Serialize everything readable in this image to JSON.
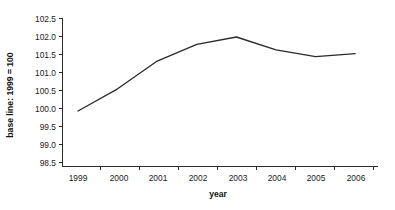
{
  "chart_data": {
    "type": "line",
    "title": "",
    "subtitle": "",
    "xlabel": "year",
    "ylabel": "base line: 1999 = 100",
    "categories": [
      "1999",
      "2000",
      "2001",
      "2002",
      "2003",
      "2004",
      "2005",
      "2006"
    ],
    "x": [
      1999,
      2000,
      2001,
      2002,
      2003,
      2004,
      2005,
      2006
    ],
    "values": [
      100.0,
      100.6,
      101.35,
      101.8,
      102.0,
      101.65,
      101.47,
      101.55
    ],
    "series": [
      {
        "name": "index",
        "values": [
          100.0,
          100.6,
          101.35,
          101.8,
          102.0,
          101.65,
          101.47,
          101.55
        ]
      }
    ],
    "ylim": [
      98.5,
      102.5
    ],
    "yticks": [
      98.5,
      99.0,
      99.5,
      100.0,
      100.5,
      101.0,
      101.5,
      102.0,
      102.5
    ],
    "ytick_labels": [
      "98.5",
      "99.0",
      "99.5",
      "100.0",
      "100.5",
      "101.0",
      "101.5",
      "102.0",
      "102.5"
    ],
    "xtick_labels": [
      "1999",
      "2000",
      "2001",
      "2002",
      "2003",
      "2004",
      "2005",
      "2006"
    ],
    "grid": false,
    "legend": false,
    "legend_position": "none",
    "line_color": "#2b2b2b",
    "axis_color": "#2a2a2a",
    "background_color": "#ffffff"
  }
}
